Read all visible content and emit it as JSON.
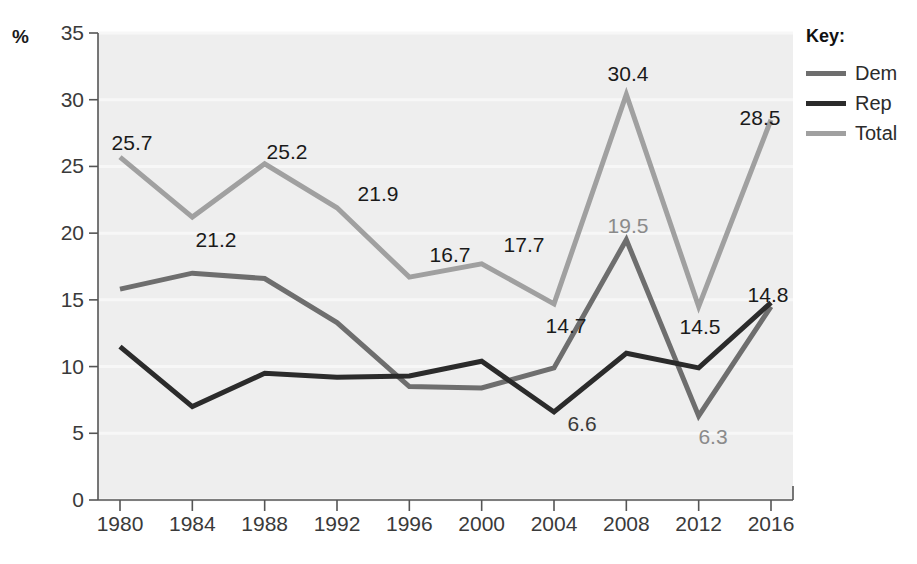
{
  "chart_data": {
    "type": "line",
    "title": "",
    "xlabel": "",
    "ylabel": "%",
    "categories": [
      "1980",
      "1984",
      "1988",
      "1992",
      "1996",
      "2000",
      "2004",
      "2008",
      "2012",
      "2016"
    ],
    "ylim": [
      0,
      35
    ],
    "yticks": [
      "0",
      "5",
      "10",
      "15",
      "20",
      "25",
      "30",
      "35"
    ],
    "grid": true,
    "legend_position": "right",
    "series": [
      {
        "name": "Dem",
        "color": "#6e6e6e",
        "values": [
          15.8,
          17.0,
          16.6,
          13.3,
          8.5,
          8.4,
          9.9,
          19.5,
          6.3,
          14.5
        ]
      },
      {
        "name": "Rep",
        "color": "#2b2b2b",
        "values": [
          11.5,
          7.0,
          9.5,
          9.2,
          9.3,
          10.4,
          6.6,
          11.0,
          9.9,
          14.8
        ]
      },
      {
        "name": "Total",
        "color": "#a0a0a0",
        "values": [
          25.7,
          21.2,
          25.2,
          21.9,
          16.7,
          17.7,
          14.7,
          30.4,
          14.5,
          28.5
        ]
      }
    ],
    "annotations": [
      {
        "text": "25.7",
        "series": "Total",
        "x": "1980",
        "value": 25.7,
        "px": 132,
        "py": 143,
        "color": "#1a1a1a"
      },
      {
        "text": "21.2",
        "series": "Total",
        "x": "1984",
        "value": 21.2,
        "px": 216,
        "py": 240,
        "color": "#1a1a1a"
      },
      {
        "text": "25.2",
        "series": "Total",
        "x": "1988",
        "value": 25.2,
        "px": 287,
        "py": 152,
        "color": "#1a1a1a"
      },
      {
        "text": "21.9",
        "series": "Total",
        "x": "1992",
        "value": 21.9,
        "px": 378,
        "py": 194,
        "color": "#1a1a1a"
      },
      {
        "text": "16.7",
        "series": "Total",
        "x": "1996",
        "value": 16.7,
        "px": 450,
        "py": 255,
        "color": "#1a1a1a"
      },
      {
        "text": "17.7",
        "series": "Total",
        "x": "2000",
        "value": 17.7,
        "px": 524,
        "py": 245,
        "color": "#1a1a1a"
      },
      {
        "text": "14.7",
        "series": "Total",
        "x": "2004",
        "value": 14.7,
        "px": 566,
        "py": 326,
        "color": "#1a1a1a"
      },
      {
        "text": "30.4",
        "series": "Total",
        "x": "2008",
        "value": 30.4,
        "px": 628,
        "py": 74,
        "color": "#1a1a1a"
      },
      {
        "text": "14.5",
        "series": "Total",
        "x": "2012",
        "value": 14.5,
        "px": 700,
        "py": 327,
        "color": "#1a1a1a"
      },
      {
        "text": "28.5",
        "series": "Total",
        "x": "2016",
        "value": 28.5,
        "px": 760,
        "py": 118,
        "color": "#1a1a1a"
      },
      {
        "text": "19.5",
        "series": "Dem",
        "x": "2008",
        "value": 19.5,
        "px": 628,
        "py": 226,
        "color": "#8a8a8a"
      },
      {
        "text": "6.3",
        "series": "Dem",
        "x": "2012",
        "value": 6.3,
        "px": 713,
        "py": 437,
        "color": "#8a8a8a"
      },
      {
        "text": "6.6",
        "series": "Rep",
        "x": "2004",
        "value": 6.6,
        "px": 582,
        "py": 424,
        "color": "#3a3a3a"
      },
      {
        "text": "14.8",
        "series": "Rep",
        "x": "2016",
        "value": 14.8,
        "px": 768,
        "py": 295,
        "color": "#1a1a1a"
      }
    ]
  },
  "legend": {
    "title": "Key:",
    "items": [
      {
        "label": "Dem",
        "color": "#6e6e6e"
      },
      {
        "label": "Rep",
        "color": "#2b2b2b"
      },
      {
        "label": "Total",
        "color": "#a0a0a0"
      }
    ]
  },
  "axes": {
    "y_unit": "%"
  }
}
